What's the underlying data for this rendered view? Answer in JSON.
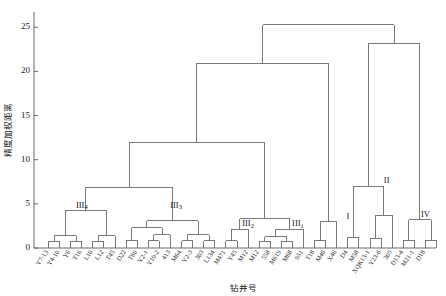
{
  "chart_data": {
    "type": "dendrogram",
    "title": "",
    "xlabel": "钻井号",
    "ylabel": "精度加权距离",
    "ylim": [
      0,
      26.5
    ],
    "yticks": [
      0,
      5,
      10,
      15,
      20,
      25
    ],
    "ytick_labels": [
      "0",
      "5",
      "10",
      "15",
      "20",
      "25"
    ],
    "grid": false,
    "legend": "none",
    "leaf_labels": [
      "Y7-13",
      "Y4-10",
      "Y6",
      "T16",
      "L10",
      "L12",
      "T45",
      "D22",
      "T60",
      "Y2-1",
      "Y10-2",
      "413",
      "M64",
      "Y2-3",
      "303",
      "L134",
      "M471",
      "Y45",
      "M12",
      "M12",
      "558",
      "M619",
      "M68",
      "951",
      "T18",
      "M46",
      "X46",
      "D4",
      "M58",
      "XQK13-1",
      "Y23-6",
      "305",
      "D13-4",
      "M21-1",
      "D18"
    ],
    "cluster_labels": [
      {
        "name": "III",
        "sub": "4",
        "leaf_from": 0,
        "leaf_to": 6,
        "height": 4.2
      },
      {
        "name": "III",
        "sub": "3",
        "leaf_from": 7,
        "leaf_to": 16,
        "height": 4.2
      },
      {
        "name": "III",
        "sub": "2",
        "leaf_from": 17,
        "leaf_to": 19,
        "height": 2.1
      },
      {
        "name": "III",
        "sub": "1",
        "leaf_from": 20,
        "leaf_to": 25,
        "height": 2.1
      },
      {
        "name": "I",
        "sub": "",
        "leaf_from": 26,
        "leaf_to": 28,
        "height": 3.0
      },
      {
        "name": "II",
        "sub": "",
        "leaf_from": 29,
        "leaf_to": 32,
        "height": 7.0
      },
      {
        "name": "IV",
        "sub": "",
        "leaf_from": 33,
        "leaf_to": 35,
        "height": 3.2
      }
    ],
    "merges": [
      {
        "id": "n1",
        "left": {
          "leaf": 0
        },
        "right": {
          "leaf": 1
        },
        "height": 0.75
      },
      {
        "id": "n2",
        "left": {
          "leaf": 2
        },
        "right": {
          "leaf": 3
        },
        "height": 0.75
      },
      {
        "id": "n3",
        "left": {
          "node": "n1"
        },
        "right": {
          "node": "n2"
        },
        "height": 1.4
      },
      {
        "id": "n4",
        "left": {
          "leaf": 4
        },
        "right": {
          "leaf": 5
        },
        "height": 0.75
      },
      {
        "id": "n5",
        "left": {
          "node": "n4"
        },
        "right": {
          "leaf": 6
        },
        "height": 1.4
      },
      {
        "id": "n6",
        "left": {
          "node": "n3"
        },
        "right": {
          "node": "n5"
        },
        "height": 4.2
      },
      {
        "id": "n7",
        "left": {
          "leaf": 7
        },
        "right": {
          "leaf": 8
        },
        "height": 0.9
      },
      {
        "id": "n8",
        "left": {
          "leaf": 9
        },
        "right": {
          "leaf": 10
        },
        "height": 0.8
      },
      {
        "id": "n9",
        "left": {
          "node": "n8"
        },
        "right": {
          "leaf": 11
        },
        "height": 1.5
      },
      {
        "id": "n10",
        "left": {
          "node": "n7"
        },
        "right": {
          "node": "n9"
        },
        "height": 2.3
      },
      {
        "id": "n11",
        "left": {
          "leaf": 12
        },
        "right": {
          "leaf": 13
        },
        "height": 0.8
      },
      {
        "id": "n12",
        "left": {
          "leaf": 14
        },
        "right": {
          "leaf": 15
        },
        "height": 0.8
      },
      {
        "id": "n13",
        "left": {
          "node": "n11"
        },
        "right": {
          "node": "n12"
        },
        "height": 1.5
      },
      {
        "id": "n14",
        "left": {
          "node": "n10"
        },
        "right": {
          "node": "n13"
        },
        "height": 3.1
      },
      {
        "id": "n15",
        "left": {
          "node": "n6"
        },
        "right": {
          "node": "n14"
        },
        "height": 6.9
      },
      {
        "id": "n16",
        "left": {
          "leaf": 16
        },
        "right": {
          "leaf": 17
        },
        "height": 0.8
      },
      {
        "id": "n17",
        "left": {
          "node": "n16"
        },
        "right": {
          "leaf": 18
        },
        "height": 2.1
      },
      {
        "id": "n18",
        "left": {
          "leaf": 19
        },
        "right": {
          "leaf": 20
        },
        "height": 0.75
      },
      {
        "id": "n19",
        "left": {
          "leaf": 21
        },
        "right": {
          "leaf": 22
        },
        "height": 0.75
      },
      {
        "id": "n20",
        "left": {
          "node": "n18"
        },
        "right": {
          "node": "n19"
        },
        "height": 1.3
      },
      {
        "id": "n21",
        "left": {
          "node": "n20"
        },
        "right": {
          "leaf": 23
        },
        "height": 2.1
      },
      {
        "id": "n22",
        "left": {
          "node": "n17"
        },
        "right": {
          "node": "n21"
        },
        "height": 3.3
      },
      {
        "id": "n23",
        "left": {
          "node": "n15"
        },
        "right": {
          "node": "n22"
        },
        "height": 11.9
      },
      {
        "id": "n24",
        "left": {
          "leaf": 24
        },
        "right": {
          "leaf": 25
        },
        "height": 0.9
      },
      {
        "id": "n25",
        "left": {
          "node": "n24"
        },
        "right": {
          "leaf": 26
        },
        "height": 3.0
      },
      {
        "id": "n26",
        "left": {
          "node": "n23"
        },
        "right": {
          "node": "n25"
        },
        "height": 20.9
      },
      {
        "id": "n27",
        "left": {
          "leaf": 27
        },
        "right": {
          "leaf": 28
        },
        "height": 1.2
      },
      {
        "id": "n28",
        "left": {
          "leaf": 29
        },
        "right": {
          "leaf": 30
        },
        "height": 1.1
      },
      {
        "id": "n29",
        "left": {
          "node": "n28"
        },
        "right": {
          "leaf": 31
        },
        "height": 3.7
      },
      {
        "id": "n30",
        "left": {
          "node": "n27"
        },
        "right": {
          "node": "n29"
        },
        "height": 7.0
      },
      {
        "id": "n31",
        "left": {
          "leaf": 32
        },
        "right": {
          "leaf": 33
        },
        "height": 0.9
      },
      {
        "id": "n32",
        "left": {
          "leaf": 34
        },
        "right": {
          "leaf": 35
        },
        "height": 0.9
      },
      {
        "id": "n33",
        "left": {
          "node": "n31"
        },
        "right": {
          "node": "n32"
        },
        "height": 3.2
      },
      {
        "id": "n34",
        "left": {
          "node": "n30"
        },
        "right": {
          "node": "n33"
        },
        "height": 23.2
      },
      {
        "id": "n35",
        "left": {
          "node": "n26"
        },
        "right": {
          "node": "n34"
        },
        "height": 25.3
      }
    ]
  }
}
